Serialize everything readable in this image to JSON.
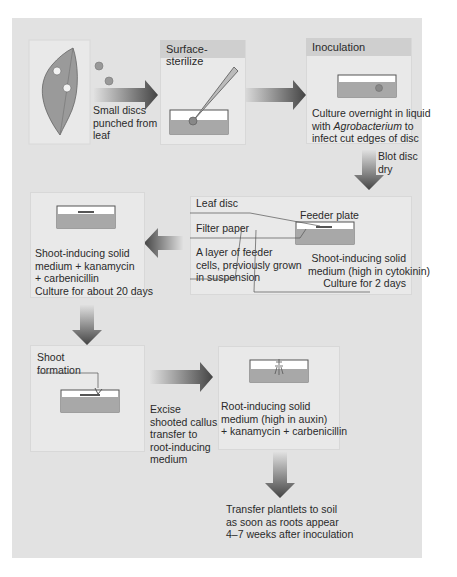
{
  "steps": {
    "leaf": {
      "caption": [
        "Small discs",
        "punched from",
        "leaf"
      ]
    },
    "sterilize": {
      "title": "Surface-sterilize"
    },
    "inoculation": {
      "title": "Inoculation",
      "caption_pre": "Culture overnight in liquid",
      "caption_with": "with ",
      "caption_italic": "Agrobacterium",
      "caption_to": " to",
      "caption_end": "infect cut edges of disc"
    },
    "blot": {
      "caption": [
        "Blot disc",
        "dry"
      ]
    },
    "feeder": {
      "label_leaf_disc": "Leaf disc",
      "label_feeder_plate": "Feeder plate",
      "label_filter_paper": "Filter paper",
      "label_feeder_cells": [
        "A layer of feeder",
        "cells, previously grown",
        "in suspension"
      ],
      "caption": [
        "Shoot-inducing solid",
        "medium (high in cytokinin)",
        "Culture for 2 days"
      ]
    },
    "shoot_medium": {
      "caption": [
        "Shoot-inducing solid",
        "medium + kanamycin",
        "+ carbenicillin",
        "Culture for about 20 days"
      ]
    },
    "shoot_formation": {
      "label": [
        "Shoot",
        "formation"
      ]
    },
    "excise": {
      "caption": [
        "Excise",
        "shooted callus,",
        "transfer to",
        "root-inducing",
        "medium"
      ]
    },
    "root_medium": {
      "caption": [
        "Root-inducing solid",
        "medium (high in auxin)",
        " + kanamycin + carbenicillin"
      ]
    },
    "transfer": {
      "caption": [
        "Transfer plantlets to soil",
        "as soon as roots appear",
        "4–7 weeks after inoculation"
      ]
    }
  },
  "colors": {
    "background": "#e2e2e2",
    "panel": "#e9e9e9",
    "header": "#cfcfcf",
    "medium": "#a8a8a8",
    "arrow": "#555555"
  }
}
